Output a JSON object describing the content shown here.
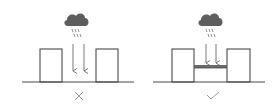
{
  "diagram": {
    "panels": [
      {
        "id": "incorrect",
        "result_symbol": "✕",
        "result_meaning": "incorrect",
        "cloud_icon": "rain-cloud-icon",
        "has_bridge": false
      },
      {
        "id": "correct",
        "result_symbol": "✓",
        "result_meaning": "correct",
        "cloud_icon": "rain-cloud-icon",
        "has_bridge": true
      }
    ],
    "colors": {
      "line": "#4a4a4a",
      "cloud": "#5e5e5e",
      "rain": "#7a7a7a",
      "symbol": "#9a9a9a",
      "background": "#ffffff"
    }
  }
}
